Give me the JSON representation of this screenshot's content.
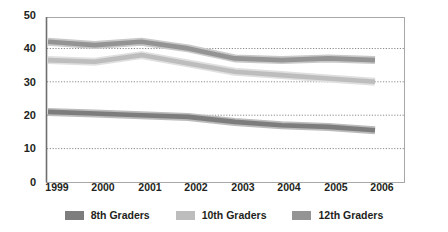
{
  "chart_data": {
    "type": "line",
    "title": "",
    "xlabel": "",
    "ylabel": "",
    "categories": [
      "1999",
      "2000",
      "2001",
      "2002",
      "2003",
      "2004",
      "2005",
      "2006"
    ],
    "series": [
      {
        "name": "8th Graders",
        "color": "#7d7d7d",
        "values": [
          21,
          20.5,
          20,
          19.5,
          18,
          17,
          16.5,
          15.5
        ]
      },
      {
        "name": "10th Graders",
        "color": "#bdbdbd",
        "values": [
          36.5,
          36,
          38,
          35.5,
          33,
          32,
          31,
          30
        ]
      },
      {
        "name": "12th Graders",
        "color": "#949494",
        "values": [
          42,
          41,
          42,
          40,
          37,
          36.5,
          37,
          36.5
        ]
      }
    ],
    "ylim": [
      0,
      50
    ],
    "yticks": [
      "0",
      "10",
      "20",
      "30",
      "40",
      "50"
    ],
    "ytick_values": [
      0,
      10,
      20,
      30,
      40,
      50
    ],
    "gridlines_at": [
      10,
      20,
      30,
      40
    ],
    "grid": true,
    "grid_style": "dotted",
    "grid_color": "#8c8c8c",
    "frame_color": "#a0a0a0",
    "axis_color": "#808080",
    "legend_position": "bottom",
    "legend": [
      "8th Graders",
      "10th Graders",
      "12th Graders"
    ],
    "background": "#ffffff"
  }
}
